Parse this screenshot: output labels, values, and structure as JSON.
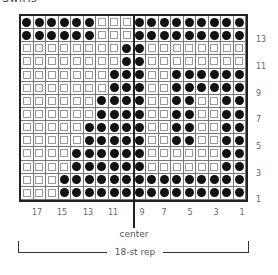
{
  "title": "Swirls",
  "chart": {
    "columns": 18,
    "rows": 14,
    "legend": {
      "filled": "dark dot",
      "empty": "light square"
    },
    "grid_rows_top_to_bottom": [
      {
        "row": 14,
        "pattern": "111111000111111111"
      },
      {
        "row": 13,
        "pattern": "111111000111111111"
      },
      {
        "row": 12,
        "pattern": "000000001100000000"
      },
      {
        "row": 11,
        "pattern": "000000001100000000"
      },
      {
        "row": 10,
        "pattern": "000000011100111111"
      },
      {
        "row": 9,
        "pattern": "000000011100111111"
      },
      {
        "row": 8,
        "pattern": "000000111100110011"
      },
      {
        "row": 7,
        "pattern": "000000111100110011"
      },
      {
        "row": 6,
        "pattern": "000001111100110011"
      },
      {
        "row": 5,
        "pattern": "000001111100110011"
      },
      {
        "row": 4,
        "pattern": "000011111100000011"
      },
      {
        "row": 3,
        "pattern": "000011111100000011"
      },
      {
        "row": 2,
        "pattern": "000111111111111111"
      },
      {
        "row": 1,
        "pattern": "000111111111111111"
      }
    ],
    "row_labels": [
      "13",
      "11",
      "9",
      "7",
      "5",
      "3",
      "1"
    ],
    "column_labels": [
      "17",
      "15",
      "13",
      "11",
      "9",
      "7",
      "5",
      "3",
      "1"
    ],
    "center_label": "center",
    "repeat_label": "18-st rep"
  }
}
